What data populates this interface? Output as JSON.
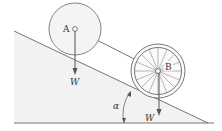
{
  "diagram": {
    "title": "",
    "labels": {
      "a": "A",
      "b": "B",
      "w_a": "W",
      "w_b": "W",
      "angle": "α"
    },
    "colors": {
      "stroke": "#666666",
      "ground_fill": "#f2f2f2",
      "wheel_rim": "#777777",
      "text": "#333333"
    },
    "elements": [
      {
        "type": "incline",
        "angle_label": "α"
      },
      {
        "type": "disk",
        "label": "A",
        "weight": "W"
      },
      {
        "type": "spoked-wheel",
        "label": "B",
        "weight": "W"
      },
      {
        "type": "connecting-link",
        "from": "A",
        "to": "B"
      }
    ]
  }
}
